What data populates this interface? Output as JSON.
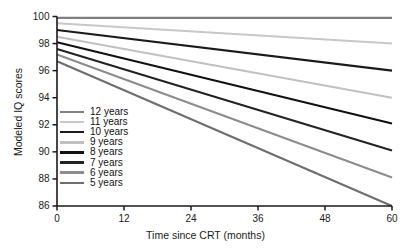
{
  "chart_data": {
    "type": "line",
    "title": "",
    "xlabel": "Time since CRT (months)",
    "ylabel": "Modeled IQ scores",
    "xlim": [
      0,
      60
    ],
    "ylim": [
      86,
      100
    ],
    "xticks": [
      0,
      12,
      24,
      36,
      48,
      60
    ],
    "yticks": [
      86,
      88,
      90,
      92,
      94,
      96,
      98,
      100
    ],
    "xtick_labels": [
      "0",
      "12",
      "24",
      "36",
      "48",
      "60"
    ],
    "ytick_labels": [
      "86",
      "88",
      "90",
      "92",
      "94",
      "96",
      "98",
      "100"
    ],
    "grid": false,
    "legend_position": "inside-left-center",
    "x": [
      0,
      60
    ],
    "series": [
      {
        "name": "12 years",
        "values": [
          99.9,
          99.9
        ],
        "color": "#808080"
      },
      {
        "name": "11 years",
        "values": [
          99.5,
          98.0
        ],
        "color": "#c8c8c8"
      },
      {
        "name": "10 years",
        "values": [
          99.0,
          96.0
        ],
        "color": "#1a1a1a"
      },
      {
        "name": "9 years",
        "values": [
          98.5,
          94.0
        ],
        "color": "#c0c0c0"
      },
      {
        "name": "8 years",
        "values": [
          98.1,
          92.1
        ],
        "color": "#111111"
      },
      {
        "name": "7 years",
        "values": [
          97.6,
          90.1
        ],
        "color": "#222222"
      },
      {
        "name": "6 years",
        "values": [
          97.2,
          88.1
        ],
        "color": "#8c8c8c"
      },
      {
        "name": "5 years",
        "values": [
          96.7,
          86.0
        ],
        "color": "#6e6e6e"
      }
    ]
  },
  "axes": {
    "x_title": "Time since CRT (months)",
    "y_title": "Modeled IQ scores"
  },
  "legend": {
    "items": [
      {
        "label": "12 years"
      },
      {
        "label": "11 years"
      },
      {
        "label": "10 years"
      },
      {
        "label": "9 years"
      },
      {
        "label": "8 years"
      },
      {
        "label": "7 years"
      },
      {
        "label": "6 years"
      },
      {
        "label": "5 years"
      }
    ]
  }
}
